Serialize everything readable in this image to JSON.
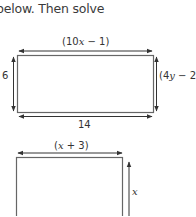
{
  "intro_text": "below. Then solve",
  "figures": [
    {
      "shape": "rectangle",
      "labels": {
        "top": {
          "pre": "(10",
          "var": "x",
          "post": " − 1)"
        },
        "left": "6",
        "right": {
          "pre": "(4",
          "var": "y",
          "post": " − 2)"
        },
        "bottom": "14"
      }
    },
    {
      "shape": "rectangle",
      "labels": {
        "top": {
          "pre": "(",
          "var": "x",
          "post": " + 3)"
        },
        "right": {
          "var": "x"
        }
      }
    }
  ],
  "colors": {
    "stroke": "#555555",
    "text": "#333333"
  }
}
